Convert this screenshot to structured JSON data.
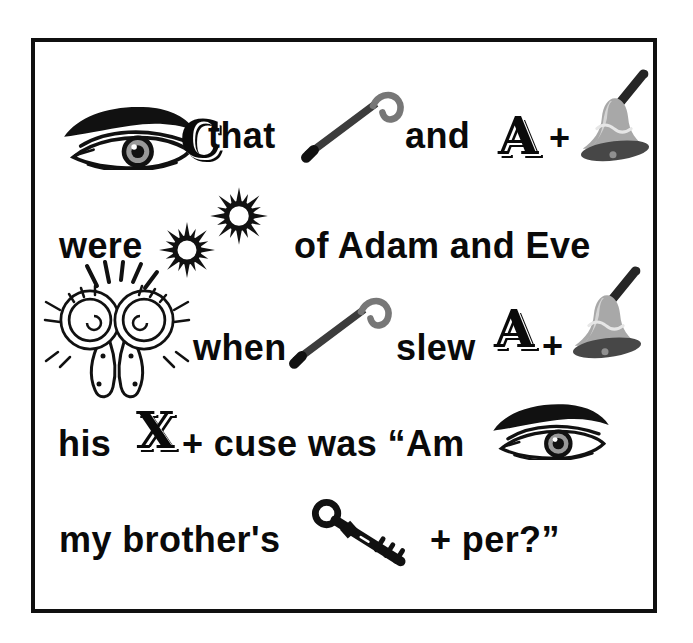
{
  "puzzle": {
    "type": "rebus-puzzle",
    "line1": {
      "c": "C",
      "that": "that",
      "and": "and",
      "abel_a": "A",
      "plus": "+"
    },
    "line2": {
      "were": "were",
      "of_adam_and_eve": "of Adam and Eve"
    },
    "line3": {
      "when": "when",
      "slew": "slew",
      "abel_a": "A",
      "plus": "+"
    },
    "line4": {
      "his": "his",
      "x": "X",
      "cuse_was_am": "+ cuse was “Am"
    },
    "line5": {
      "my_brothers": "my brother's",
      "per": "+ per?”"
    }
  },
  "icons": {
    "eye": "eye-icon",
    "cane": "cane-icon",
    "bell": "bell-icon",
    "suns": "twin-suns-icon",
    "ram": "ram-heads-icon",
    "key": "key-icon"
  },
  "colors": {
    "ink": "#0a0a0a",
    "paper": "#ffffff",
    "frame_border": "#101010",
    "bell_body": "#a8a8a8",
    "bell_highlight": "#d4d4d4",
    "bell_rim": "#474747",
    "bell_handle": "#262626",
    "cane_shaft": "#3c3c3c",
    "cane_hook": "#777777",
    "iris_gray": "#999999"
  }
}
